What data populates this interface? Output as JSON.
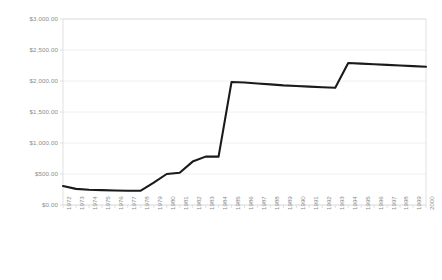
{
  "chart_data": {
    "type": "line",
    "title": "",
    "subtitle": "",
    "xlabel": "",
    "ylabel": "",
    "grid": true,
    "legend": null,
    "legend_position": "none",
    "xlim": [
      1972,
      2000
    ],
    "ylim": [
      0,
      3000
    ],
    "ytick_labels": [
      "$0.00",
      "$500.00",
      "$1,000.00",
      "$1,500.00",
      "$2,000.00",
      "$2,500.00",
      "$3,000.00"
    ],
    "ytick_values": [
      0,
      500,
      1000,
      1500,
      2000,
      2500,
      3000
    ],
    "categories": [
      "1972",
      "1973",
      "1974",
      "1975",
      "1976",
      "1977",
      "1978",
      "1979",
      "1980",
      "1981",
      "1982",
      "1983",
      "1984",
      "1985",
      "1986",
      "1987",
      "1988",
      "1989",
      "1990",
      "1991",
      "1992",
      "1993",
      "1994",
      "1995",
      "1996",
      "1997",
      "1998",
      "1999",
      "2000"
    ],
    "x": [
      1972,
      1973,
      1974,
      1975,
      1976,
      1977,
      1978,
      1979,
      1980,
      1981,
      1982,
      1983,
      1984,
      1985,
      1986,
      1987,
      1988,
      1989,
      1990,
      1991,
      1992,
      1993,
      1994,
      1995,
      1996,
      1997,
      1998,
      1999,
      2000
    ],
    "values": [
      305,
      260,
      245,
      240,
      235,
      230,
      232,
      360,
      500,
      520,
      700,
      780,
      780,
      1985,
      1975,
      1960,
      1945,
      1930,
      1920,
      1910,
      1900,
      1890,
      2290,
      2280,
      2270,
      2260,
      2250,
      2240,
      2230
    ],
    "series": [
      {
        "name": "series-1",
        "color": "#1a1a1a",
        "values": [
          305,
          260,
          245,
          240,
          235,
          230,
          232,
          360,
          500,
          520,
          700,
          780,
          780,
          1985,
          1975,
          1960,
          1945,
          1930,
          1920,
          1910,
          1900,
          1890,
          2290,
          2280,
          2270,
          2260,
          2250,
          2240,
          2230
        ]
      }
    ],
    "colors": {
      "line": "#1a1a1a",
      "grid": "#ececec",
      "axis": "#d9d9d9",
      "tick_text": "#8d8d8d",
      "background": "#ffffff"
    }
  }
}
